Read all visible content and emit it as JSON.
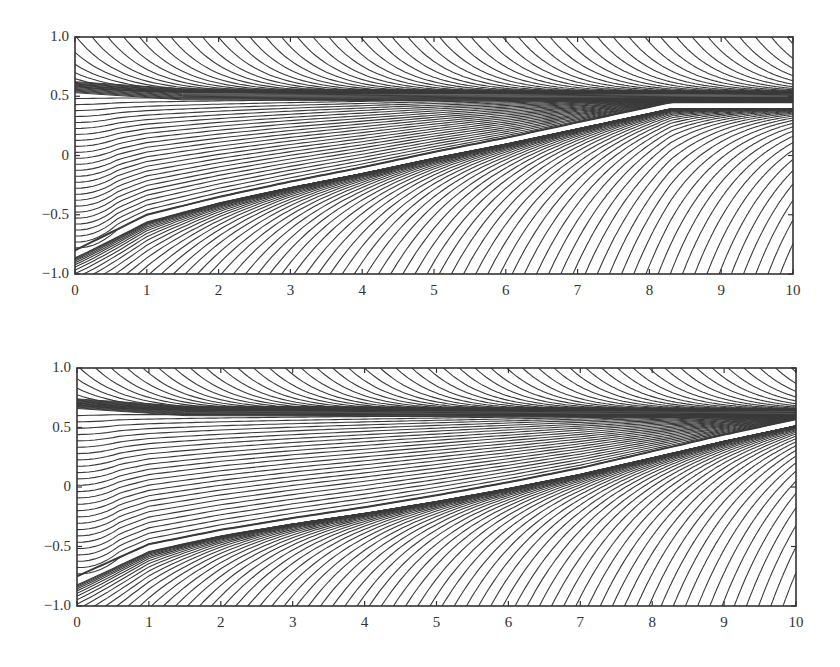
{
  "chart_data": [
    {
      "type": "line",
      "title": "",
      "xlabel": "",
      "ylabel": "",
      "xlim": [
        0,
        10
      ],
      "ylim": [
        -1.0,
        1.0
      ],
      "x_ticks": [
        "0",
        "1",
        "2",
        "3",
        "4",
        "5",
        "6",
        "7",
        "8",
        "9",
        "10"
      ],
      "y_ticks": [
        "1.0",
        "0.5",
        "0",
        "-0.5",
        "-1.0"
      ],
      "grid": false,
      "legend": null,
      "description": "Family of solution curves (trajectories). Upper family converges to a dense band near y=0.5; lower family bounded by a separatrix rising from y≈-0.8 at x=0 to join the band near x≈8.3.",
      "features": {
        "attracting_band_y": 0.5,
        "band_halfwidth": 0.05,
        "separatrix": {
          "x": [
            0,
            1,
            2,
            3,
            4,
            5,
            6,
            7,
            8,
            8.3
          ],
          "y": [
            -0.8,
            -0.5,
            -0.35,
            -0.22,
            -0.1,
            0.03,
            0.15,
            0.28,
            0.41,
            0.45
          ]
        }
      },
      "render": {
        "plot_box": {
          "left": 75,
          "top": 37,
          "right": 793,
          "bottom": 274
        },
        "curve_count": 70
      }
    },
    {
      "type": "line",
      "title": "",
      "xlabel": "",
      "ylabel": "",
      "xlim": [
        0,
        10
      ],
      "ylim": [
        -1.0,
        1.0
      ],
      "x_ticks": [
        "0",
        "1",
        "2",
        "3",
        "4",
        "5",
        "6",
        "7",
        "8",
        "9",
        "10"
      ],
      "y_ticks": [
        "1.0",
        "0.5",
        "0",
        "-0.5",
        "-1.0"
      ],
      "grid": false,
      "legend": null,
      "description": "Family of solution curves (trajectories). Upper family converges to a dense band near y=0.6; lower family bounded by a separatrix rising from y≈-0.75 at x=0 to y≈0.57 at x=10.",
      "features": {
        "attracting_band_y": 0.62,
        "band_halfwidth": 0.04,
        "separatrix": {
          "x": [
            0,
            1,
            2,
            3,
            4,
            5,
            6,
            7,
            8,
            9,
            10
          ],
          "y": [
            -0.75,
            -0.48,
            -0.36,
            -0.26,
            -0.17,
            -0.07,
            0.04,
            0.16,
            0.3,
            0.44,
            0.57
          ]
        }
      },
      "render": {
        "plot_box": {
          "left": 77,
          "top": 368,
          "right": 796,
          "bottom": 606
        },
        "curve_count": 70
      }
    }
  ],
  "colors": {
    "line": "#3a3a3a",
    "axis": "#333333",
    "background": "#ffffff"
  }
}
